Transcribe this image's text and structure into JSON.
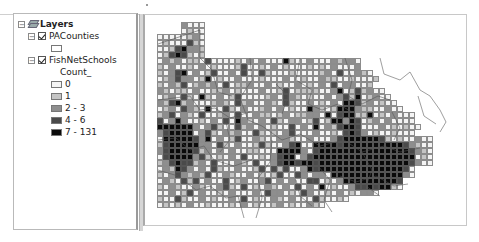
{
  "toc": {
    "root_label": "Layers",
    "layers": [
      {
        "name": "PACounties",
        "checked": true,
        "expanded": true,
        "symbol_color": "#ffffff"
      },
      {
        "name": "FishNetSchools",
        "checked": true,
        "expanded": true,
        "field": "Count_",
        "classes": [
          {
            "label": "0",
            "color": "#f4f4f4"
          },
          {
            "label": "1",
            "color": "#c4c4c4"
          },
          {
            "label": "2 - 3",
            "color": "#8e8e8e"
          },
          {
            "label": "4 - 6",
            "color": "#4a4a4a"
          },
          {
            "label": "7 - 131",
            "color": "#0a0a0a"
          }
        ]
      }
    ]
  },
  "map": {
    "grid_origin": [
      157,
      22
    ],
    "cell_size": 6,
    "rows": [
      "....2000........................................",
      "....0100........................................",
      "00000120........................................",
      "01000310........................................",
      "00134221........................................",
      "01343101........................................",
      "0212011030000102020004100200021220.............",
      "1020010201000130010201000101020002.............",
      "102340201300203003100010000120300210...........",
      "0123220140100200010002001002110010001..........",
      "102130121203011200201002010203022001..........",
      "21011020011201000200130111100240131200.........",
      "012031041020130000120321010020231401200........",
      "2134120001210312002103100201020443120100.......",
      "01203210400310200120201004210144421100200.....",
      "1230210300120300211012011220403441140102000...",
      "3024200102030421020310220130144243012020000...",
      "44444420231003120201003020402134430002010100..",
      "2344440231021200310102300020010343201001000..",
      "0444443240201300210022100200023444444310100200",
      "1344444220310200131002340044443444444444432100",
      "2344443120202001100044442034444444444444443210",
      "0344442310102030010234402344444444444444444010",
      "1234331203000210300234434434444444444444443200",
      "0214320203100200130313002434444444444444430...",
      "1023212130021002010130032022044444444444420...",
      "02103130200301200230202003301024444444443.....",
      "10210021002310301021020302040100233434410.....",
      "0020130200102000203220103200102010220.........",
      "10031002010020301002102000310010..............",
      "0101020010001020100120100210..................",
      "..............................................",
      ".............................................."
    ]
  }
}
